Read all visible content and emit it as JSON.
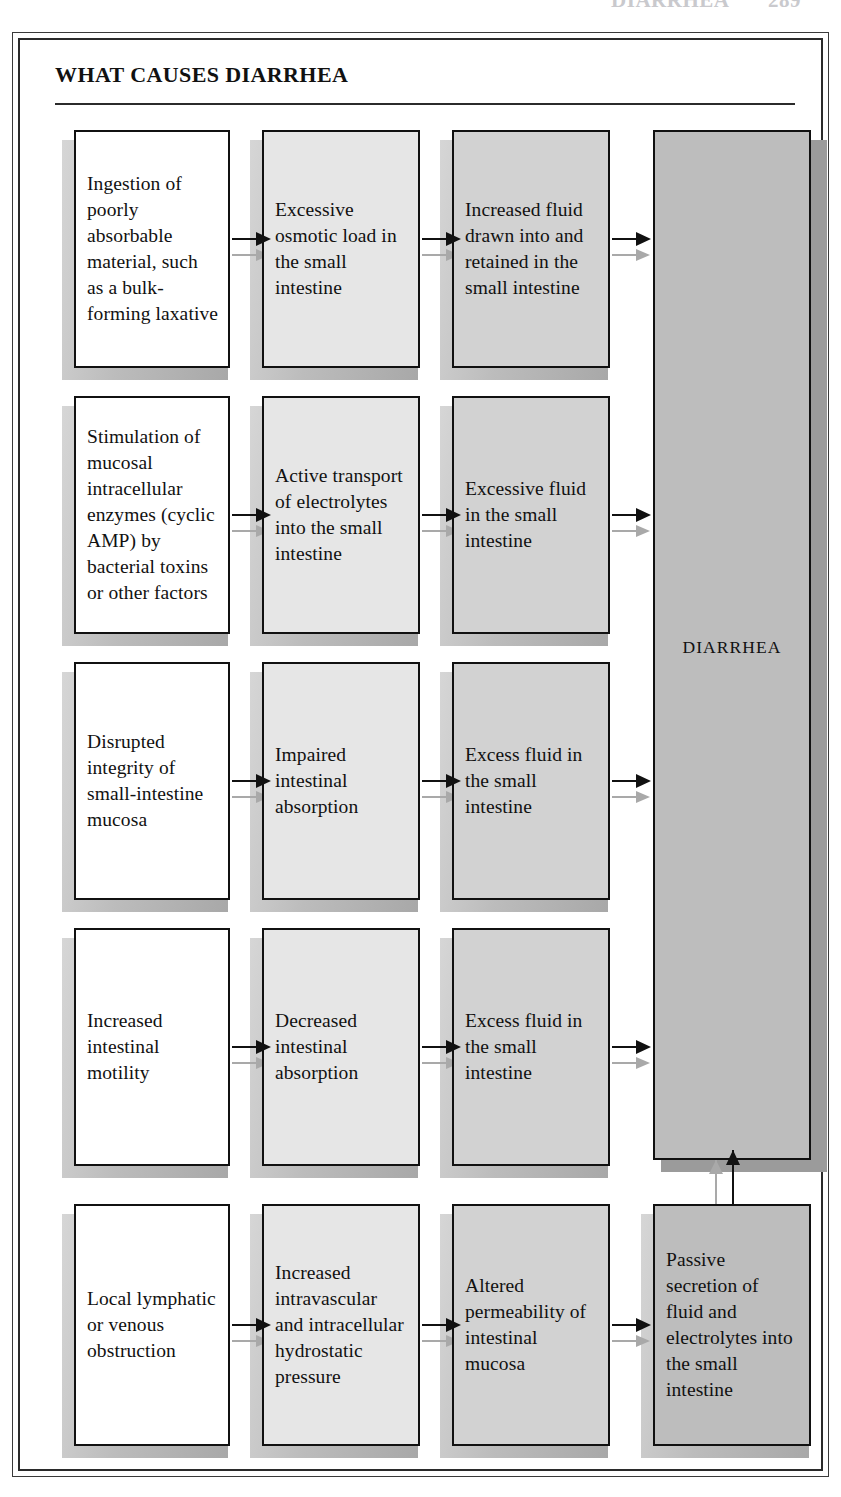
{
  "running_head": {
    "title": "DIARRHEA",
    "page": "289"
  },
  "panel": {
    "title": "WHAT CAUSES DIARRHEA",
    "terminal_label": "DIARRHEA"
  },
  "diagram": {
    "type": "flowchart",
    "columns": 4,
    "rows": 5,
    "terminal_node": "DIARRHEA",
    "rows_data": [
      {
        "id": "row-1",
        "cause": "Ingestion of poorly absorbable material, such as a bulk-forming laxative",
        "step2": "Excessive osmotic load in the small intestine",
        "step3": "Increased fluid drawn into and retained in the small intestine",
        "step4": null
      },
      {
        "id": "row-2",
        "cause": "Stimulation of mucosal intracellular enzymes (cyclic AMP) by bacterial toxins or other factors",
        "step2": "Active transport of electrolytes into the small intestine",
        "step3": "Excessive fluid in the small intestine",
        "step4": null
      },
      {
        "id": "row-3",
        "cause": "Disrupted integrity of small-intestine mucosa",
        "step2": "Impaired intestinal absorption",
        "step3": "Excess fluid in the small intestine",
        "step4": null
      },
      {
        "id": "row-4",
        "cause": "Increased intestinal motility",
        "step2": "Decreased intestinal absorption",
        "step3": "Excess fluid in the small intestine",
        "step4": null
      },
      {
        "id": "row-5",
        "cause": "Local lymphatic or venous obstruction",
        "step2": "Increased intravascular and intracellular hydrostatic pressure",
        "step3": "Altered permeability of intestinal mucosa",
        "step4": "Passive secretion of fluid and electrolytes into the small intestine"
      }
    ]
  },
  "colors": {
    "box_col1": "#ffffff",
    "box_col2": "#e6e6e6",
    "box_col3": "#d2d2d2",
    "box_col4": "#bdbdbd",
    "shadow": "#9b9b9b",
    "arrow": "#111111",
    "arrow_ghost": "#a9a9a9",
    "rule": "#2b2b2b"
  }
}
